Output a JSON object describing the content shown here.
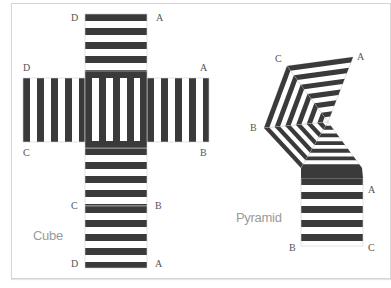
{
  "colors": {
    "stripe": "#3a3a3a",
    "stripe_gap": "#ffffff",
    "fold_line": "#cfcfcf",
    "label": "#555555",
    "caption": "#9a9a9a",
    "frame": "#d6d6d6"
  },
  "cube": {
    "caption": "Cube",
    "caption_pos": [
      33,
      240
    ],
    "faces": {
      "top": {
        "x": 85,
        "y": 14,
        "w": 62,
        "h": 64,
        "orientation": "horizontal"
      },
      "left": {
        "x": 23,
        "y": 78,
        "w": 62,
        "h": 64,
        "orientation": "vertical"
      },
      "center": {
        "x": 85,
        "y": 71,
        "w": 62,
        "h": 77,
        "orientation": "vertical"
      },
      "right": {
        "x": 147,
        "y": 78,
        "w": 62,
        "h": 64,
        "orientation": "vertical"
      },
      "lower": {
        "x": 85,
        "y": 148,
        "w": 62,
        "h": 58,
        "orientation": "horizontal"
      },
      "bottom": {
        "x": 85,
        "y": 206,
        "w": 62,
        "h": 62,
        "orientation": "horizontal"
      }
    },
    "vertex_labels": [
      {
        "text": "D",
        "x": 71,
        "y": 21
      },
      {
        "text": "A",
        "x": 156,
        "y": 21
      },
      {
        "text": "D",
        "x": 23,
        "y": 71
      },
      {
        "text": "A",
        "x": 200,
        "y": 71
      },
      {
        "text": "C",
        "x": 23,
        "y": 156
      },
      {
        "text": "B",
        "x": 200,
        "y": 156
      },
      {
        "text": "C",
        "x": 71,
        "y": 209
      },
      {
        "text": "B",
        "x": 155,
        "y": 209
      },
      {
        "text": "D",
        "x": 71,
        "y": 267
      },
      {
        "text": "A",
        "x": 155,
        "y": 267
      }
    ]
  },
  "pyramid": {
    "caption": "Pyramid",
    "caption_pos": [
      236,
      222
    ],
    "apex": [
      328,
      122
    ],
    "outer_vertices": {
      "C": [
        287,
        66
      ],
      "A": [
        353,
        57
      ],
      "B": [
        264,
        128
      ],
      "BL": [
        301,
        168
      ],
      "BR": [
        362,
        168
      ]
    },
    "base": {
      "x": 301,
      "y": 178,
      "w": 62,
      "h": 68
    },
    "vertex_labels": [
      {
        "text": "C",
        "x": 275,
        "y": 62
      },
      {
        "text": "A",
        "x": 357,
        "y": 60
      },
      {
        "text": "B",
        "x": 250,
        "y": 131
      },
      {
        "text": "A",
        "x": 368,
        "y": 193
      },
      {
        "text": "B",
        "x": 289,
        "y": 251
      },
      {
        "text": "C",
        "x": 368,
        "y": 251
      }
    ]
  }
}
